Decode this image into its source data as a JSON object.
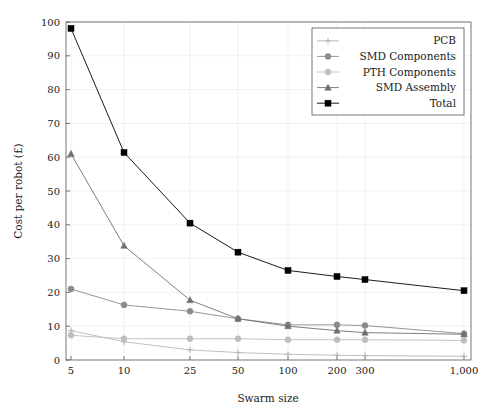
{
  "chart_data": {
    "type": "line",
    "title": "",
    "xlabel": "Swarm size",
    "ylabel": "Cost per robot (£)",
    "categories": [
      "5",
      "10",
      "25",
      "50",
      "100",
      "200",
      "300",
      "1,000"
    ],
    "x_tick_labels": [
      "5",
      "10",
      "25",
      "50",
      "100",
      "200",
      "300",
      "1,000"
    ],
    "y_tick_labels": [
      "0",
      "10",
      "20",
      "30",
      "40",
      "50",
      "60",
      "70",
      "80",
      "90",
      "100"
    ],
    "y_ticks": [
      0,
      10,
      20,
      30,
      40,
      50,
      60,
      70,
      80,
      90,
      100
    ],
    "ylim": [
      0,
      100
    ],
    "grid": true,
    "legend_position": "top-right",
    "series": [
      {
        "name": "PCB",
        "marker": "plus",
        "color": "#b9b9b9",
        "values": [
          8.7,
          5.4,
          3.0,
          2.2,
          1.7,
          1.4,
          1.3,
          1.1
        ]
      },
      {
        "name": "SMD Components",
        "marker": "circle",
        "color": "#8a8a8a",
        "values": [
          21.0,
          16.3,
          14.4,
          12.2,
          10.4,
          10.4,
          10.2,
          7.8
        ]
      },
      {
        "name": "PTH Components",
        "marker": "circle",
        "color": "#bdbdbd",
        "values": [
          7.3,
          6.3,
          6.3,
          6.3,
          6.0,
          6.0,
          6.0,
          5.8
        ]
      },
      {
        "name": "SMD Assembly",
        "marker": "triangle",
        "color": "#707070",
        "values": [
          61.0,
          33.8,
          17.7,
          12.2,
          10.0,
          8.7,
          8.1,
          7.6
        ]
      },
      {
        "name": "Total",
        "marker": "square",
        "color": "#000000",
        "values": [
          98.1,
          61.4,
          40.5,
          31.9,
          26.5,
          24.7,
          23.8,
          20.5
        ]
      }
    ]
  },
  "legend": {
    "entries": [
      {
        "label": "PCB"
      },
      {
        "label": "SMD Components"
      },
      {
        "label": "PTH Components"
      },
      {
        "label": "SMD Assembly"
      },
      {
        "label": "Total"
      }
    ]
  },
  "axes": {
    "x_title": "Swarm size",
    "y_title": "Cost per robot (£)"
  }
}
